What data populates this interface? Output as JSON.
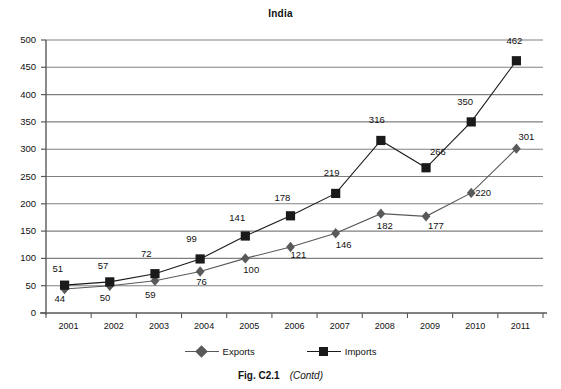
{
  "figure": {
    "caption_main": "Fig. C2.1",
    "caption_contd": "(Contd)"
  },
  "colors": {
    "series_exports": "#595959",
    "series_imports": "#1a1a1a",
    "gridline": "#808080",
    "axis": "#595959",
    "text": "#111111",
    "background": "#ffffff"
  },
  "chart_data": {
    "type": "line",
    "title": "India",
    "xlabel": "",
    "ylabel": "",
    "categories": [
      "2001",
      "2002",
      "2003",
      "2004",
      "2005",
      "2006",
      "2007",
      "2008",
      "2009",
      "2010",
      "2011"
    ],
    "x": [
      2001,
      2002,
      2003,
      2004,
      2005,
      2006,
      2007,
      2008,
      2009,
      2010,
      2011
    ],
    "series": [
      {
        "name": "Exports",
        "marker": "diamond",
        "values": [
          44,
          50,
          59,
          76,
          100,
          121,
          146,
          182,
          177,
          220,
          301
        ],
        "labels": [
          "44",
          "50",
          "59",
          "76",
          "100",
          "121",
          "146",
          "182",
          "177",
          "220",
          "301"
        ]
      },
      {
        "name": "Imports",
        "marker": "square",
        "values": [
          51,
          57,
          72,
          99,
          141,
          178,
          219,
          316,
          266,
          350,
          462
        ],
        "labels": [
          "51",
          "57",
          "72",
          "99",
          "141",
          "178",
          "219",
          "316",
          "266",
          "350",
          "462"
        ]
      }
    ],
    "ylim": [
      0,
      500
    ],
    "yticks": [
      0,
      50,
      100,
      150,
      200,
      250,
      300,
      350,
      400,
      450,
      500
    ],
    "ytick_labels": [
      "0",
      "50",
      "100",
      "150",
      "200",
      "250",
      "300",
      "350",
      "400",
      "450",
      "500"
    ],
    "grid": true,
    "grid_axis": "y",
    "legend": [
      "Exports",
      "Imports"
    ],
    "legend_position": "bottom"
  },
  "legend": {
    "exports_label": "Exports",
    "imports_label": "Imports"
  }
}
